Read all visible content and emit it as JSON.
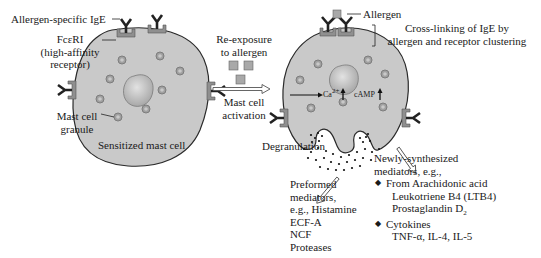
{
  "diagram": {
    "left_cell": {
      "labels": {
        "ige": "Allergen-specific IgE",
        "fcer1_line1": "FcεRI",
        "fcer1_line2": "(high-affinity",
        "fcer1_line3": "receptor)",
        "granule_line1": "Mast cell",
        "granule_line2": "granule",
        "caption": "Sensitized mast cell"
      }
    },
    "middle": {
      "top_line1": "Re-exposure",
      "top_line2": "to allergen",
      "bottom_line1": "Mast cell",
      "bottom_line2": "activation"
    },
    "right_cell": {
      "labels": {
        "allergen": "Allergen",
        "crosslink_line1": "Cross-linking of IgE by",
        "crosslink_line2": "allergen and receptor clustering",
        "ca": "Ca",
        "ca_sup": "2+",
        "camp": "cAMP",
        "degranulation": "Degranulation"
      }
    },
    "preformed": {
      "line1": "Preformed",
      "line2": "mediators,",
      "line3": "e.g., Histamine",
      "items": [
        "ECF-A",
        "NCF",
        "Proteases"
      ]
    },
    "newly_synthesized": {
      "line1": "Newly-synthesized",
      "line2": "mediators, e.g.,",
      "groups": [
        {
          "heading": "From Arachidonic acid",
          "items": [
            "Leukotriene B4 (LTB4)",
            "Prostaglandin D"
          ],
          "subscript": "2"
        },
        {
          "heading": "Cytokines",
          "items": [
            "TNF-α, IL-4, IL-5"
          ]
        }
      ]
    },
    "colors": {
      "cell_fill": "#c9c9c9",
      "cell_stroke": "#2a2a2a",
      "nucleus": "#b5b5b5",
      "granule": "#9a9a9a",
      "receptor": "#8c8c8c",
      "ige": "#2a2a2a",
      "allergen": "#a9a9a9"
    }
  }
}
